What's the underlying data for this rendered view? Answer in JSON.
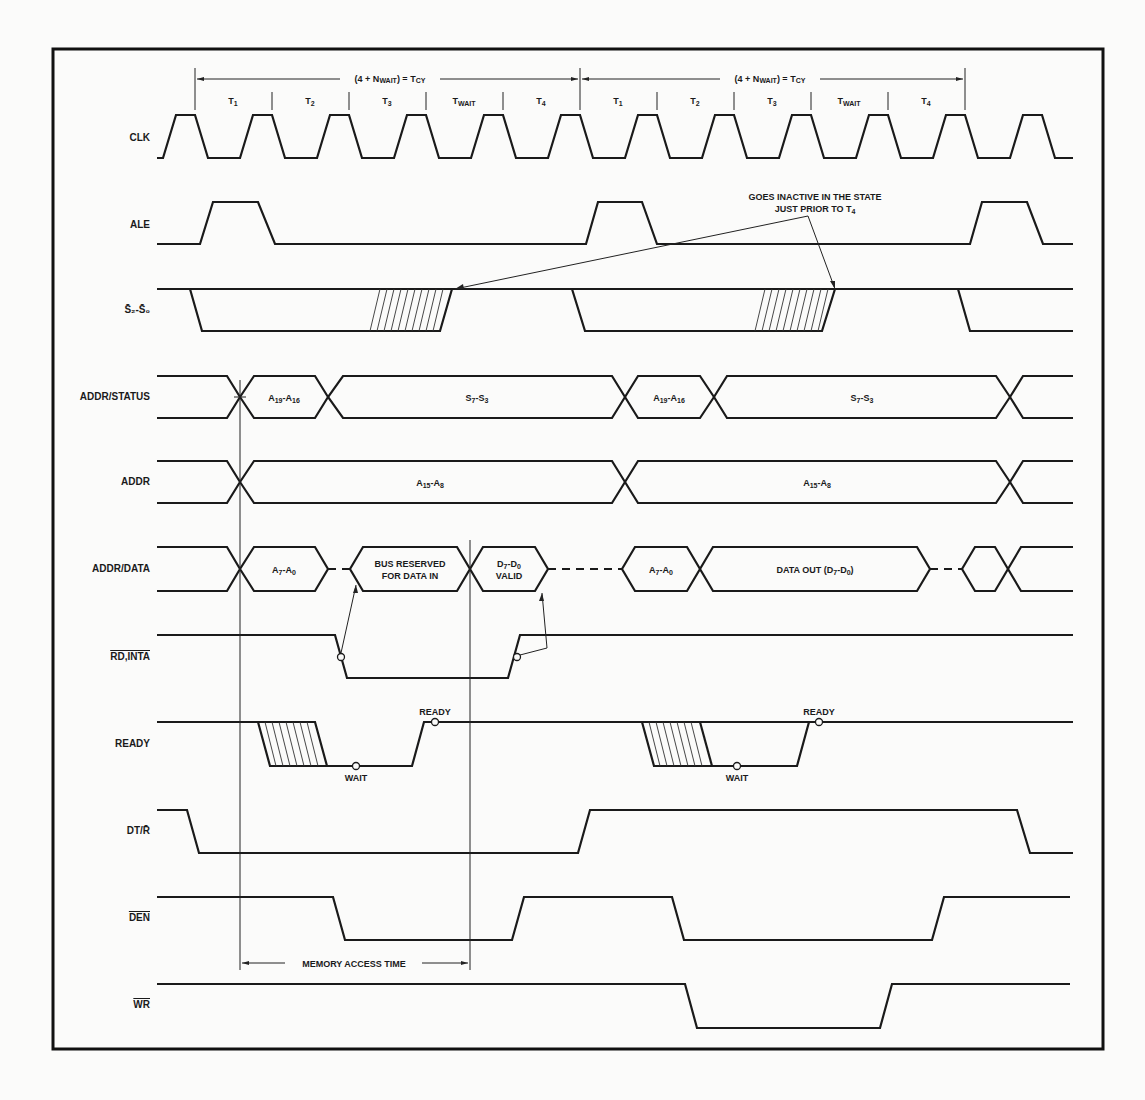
{
  "diagram": {
    "type": "timing-diagram",
    "cycle_label": {
      "prefix": "(4 + N",
      "sub": "WAIT",
      "suffix": ") = T",
      "sub2": "CY"
    },
    "states": [
      {
        "main": "T",
        "sub": "1"
      },
      {
        "main": "T",
        "sub": "2"
      },
      {
        "main": "T",
        "sub": "3"
      },
      {
        "main": "T",
        "sub": "WAIT"
      },
      {
        "main": "T",
        "sub": "4"
      }
    ],
    "signals": {
      "clk": "CLK",
      "ale": "ALE",
      "s2s0": "S2-S0",
      "addr_status": "ADDR/STATUS",
      "addr": "ADDR",
      "addr_data": "ADDR/DATA",
      "rd_inta": "RD,INTA",
      "ready": "READY",
      "dt_r": "DT/R",
      "den": "DEN",
      "wr": "WR"
    },
    "annotations": {
      "goes_inactive_1": "GOES INACTIVE IN THE STATE",
      "goes_inactive_2": "JUST PRIOR TO T",
      "goes_inactive_sub": "4",
      "a19_a16": {
        "a": "A",
        "s1": "19",
        "mid": "-A",
        "s2": "16"
      },
      "s7_s3": {
        "a": "S",
        "s1": "7",
        "mid": "-S",
        "s2": "3"
      },
      "a15_a8": {
        "a": "A",
        "s1": "15",
        "mid": "-A",
        "s2": "8"
      },
      "a7_a0": {
        "a": "A",
        "s1": "7",
        "mid": "-A",
        "s2": "0"
      },
      "bus_reserved_1": "BUS RESERVED",
      "bus_reserved_2": "FOR DATA IN",
      "d7_d0": {
        "a": "D",
        "s1": "7",
        "mid": "-D",
        "s2": "0"
      },
      "valid": "VALID",
      "data_out": {
        "a": "DATA OUT (D",
        "s1": "7",
        "mid": "-D",
        "s2": "0",
        "end": ")"
      },
      "ready": "READY",
      "wait": "WAIT",
      "memory_access_time": "MEMORY ACCESS TIME"
    }
  }
}
